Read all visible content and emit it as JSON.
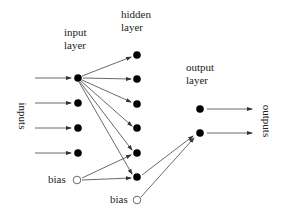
{
  "diagram": {
    "type": "feedforward-neural-network",
    "labels": {
      "input_layer": [
        "input",
        "layer"
      ],
      "hidden_layer": [
        "hidden",
        "layer"
      ],
      "output_layer": [
        "output",
        "layer"
      ],
      "inputs": "inputs",
      "outputs": "outputs",
      "input_bias": "bias",
      "hidden_bias": "bias"
    },
    "layers": {
      "input": {
        "count": 4,
        "bias": true
      },
      "hidden": {
        "count": 6,
        "bias": true
      },
      "output": {
        "count": 2
      }
    },
    "colors": {
      "node": "#000000",
      "bias_fill": "#ffffff",
      "edge": "#444444"
    }
  }
}
